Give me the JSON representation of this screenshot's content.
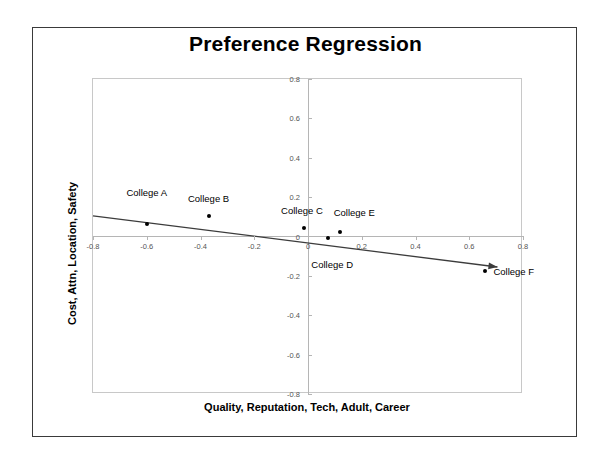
{
  "chart_data": {
    "type": "scatter",
    "title": "Preference Regression",
    "xlabel": "Quality, Reputation, Tech, Adult, Career",
    "ylabel": "Cost, Attn, Location, Safety",
    "xlim": [
      -0.8,
      0.8
    ],
    "ylim": [
      -0.8,
      0.8
    ],
    "grid": false,
    "legend": "none",
    "x_ticks": [
      "-0.8",
      "-0.6",
      "-0.4",
      "-0.2",
      "0",
      "0.2",
      "0.4",
      "0.6",
      "0.8"
    ],
    "x_tick_values": [
      -0.8,
      -0.6,
      -0.4,
      -0.2,
      0,
      0.2,
      0.4,
      0.6,
      0.8
    ],
    "y_ticks": [
      "0.8",
      "0.6",
      "0.4",
      "0.2",
      "0",
      "-0.2",
      "-0.4",
      "-0.6",
      "-0.8"
    ],
    "y_tick_values": [
      0.8,
      0.6,
      0.4,
      0.2,
      0,
      -0.2,
      -0.4,
      -0.6,
      -0.8
    ],
    "points": [
      {
        "label": "College A",
        "x": -0.6,
        "y": 0.065,
        "label_dx": 0,
        "label_dy": -32,
        "label_anchor": "center"
      },
      {
        "label": "College B",
        "x": -0.37,
        "y": 0.105,
        "label_dx": 0,
        "label_dy": -18,
        "label_anchor": "center"
      },
      {
        "label": "College C",
        "x": -0.015,
        "y": 0.045,
        "label_dx": -2,
        "label_dy": -18,
        "label_anchor": "center"
      },
      {
        "label": "College D",
        "x": 0.075,
        "y": -0.01,
        "label_dx": 4,
        "label_dy": 26,
        "label_anchor": "center"
      },
      {
        "label": "College E",
        "x": 0.12,
        "y": 0.025,
        "label_dx": 14,
        "label_dy": -20,
        "label_anchor": "center"
      },
      {
        "label": "College F",
        "x": 0.66,
        "y": -0.175,
        "label_dx": 8,
        "label_dy": 0,
        "label_anchor": "left"
      }
    ],
    "trendline": {
      "x_start": -0.8,
      "y_start": 0.105,
      "x_end": 0.705,
      "y_end": -0.155,
      "color": "#3c3c3c"
    },
    "point_color": "#000000"
  }
}
